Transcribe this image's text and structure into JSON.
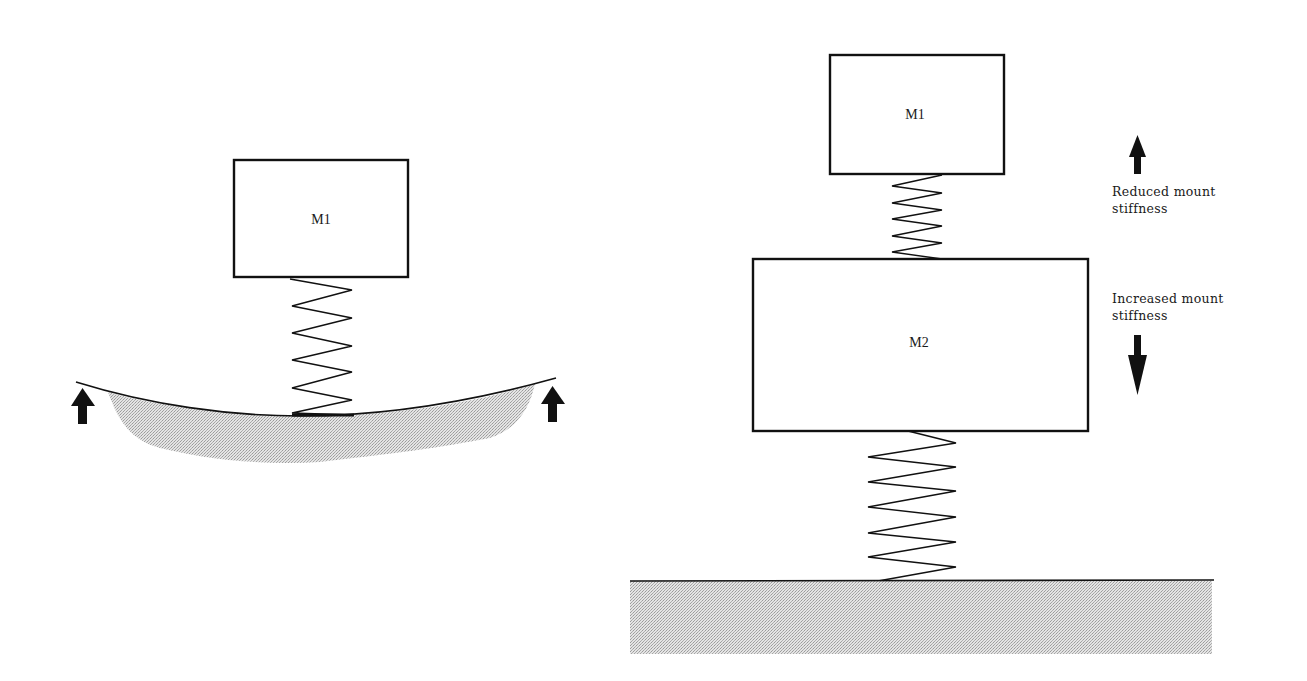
{
  "left_system": {
    "mass": {
      "label": "M1"
    },
    "support": "flexible-beam",
    "beam_reaction_arrows": [
      "up",
      "up"
    ]
  },
  "right_system": {
    "upper_mass": {
      "label": "M1"
    },
    "lower_mass": {
      "label": "M2"
    },
    "support": "rigid-ground",
    "annotations": [
      {
        "text_line1": "Reduced mount",
        "text_line2": "stiffness",
        "arrow": "up"
      },
      {
        "text_line1": "Increased mount",
        "text_line2": "stiffness",
        "arrow": "down"
      }
    ]
  },
  "colors": {
    "line": "#111111",
    "ground_fill": "#c8c8c8",
    "beam_fill": "#cfcfcf"
  }
}
